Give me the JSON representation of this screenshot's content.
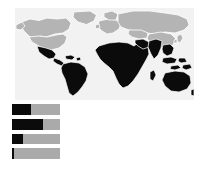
{
  "figure": {
    "title": "World map with highlighted regions and proportion bars",
    "background_color": "#ffffff"
  },
  "map": {
    "name": "world-choropleth",
    "ocean_color": "#f2f2f2",
    "land_color": "#b4b4b4",
    "highlight_color": "#0b0b0b",
    "border_color": "#ffffff",
    "highlighted_regions": [
      "Mexico",
      "Central America",
      "Caribbean",
      "South America",
      "Africa",
      "Middle East",
      "South Asia",
      "Southeast Asia",
      "Indonesia",
      "Papua New Guinea",
      "Australia",
      "New Zealand"
    ],
    "unhighlighted_regions": [
      "United States",
      "Canada",
      "Greenland",
      "Europe",
      "Russia",
      "China",
      "Mongolia",
      "Japan",
      "Korea"
    ]
  },
  "chart_data": {
    "type": "bar",
    "orientation": "horizontal",
    "title": "",
    "xlabel": "",
    "ylabel": "",
    "categories": [
      "1",
      "2",
      "3",
      "4"
    ],
    "values": [
      40,
      65,
      23,
      4
    ],
    "xlim": [
      0,
      100
    ],
    "grid": false,
    "legend": "none",
    "series": [
      {
        "name": "highlighted-share",
        "values": [
          40,
          65,
          23,
          4
        ],
        "color": "#0b0b0b"
      },
      {
        "name": "remainder",
        "values": [
          60,
          35,
          77,
          96
        ],
        "color": "#aaaaaa"
      }
    ],
    "bar_track_color": "#aaaaaa",
    "bar_fill_color": "#0b0b0b"
  }
}
